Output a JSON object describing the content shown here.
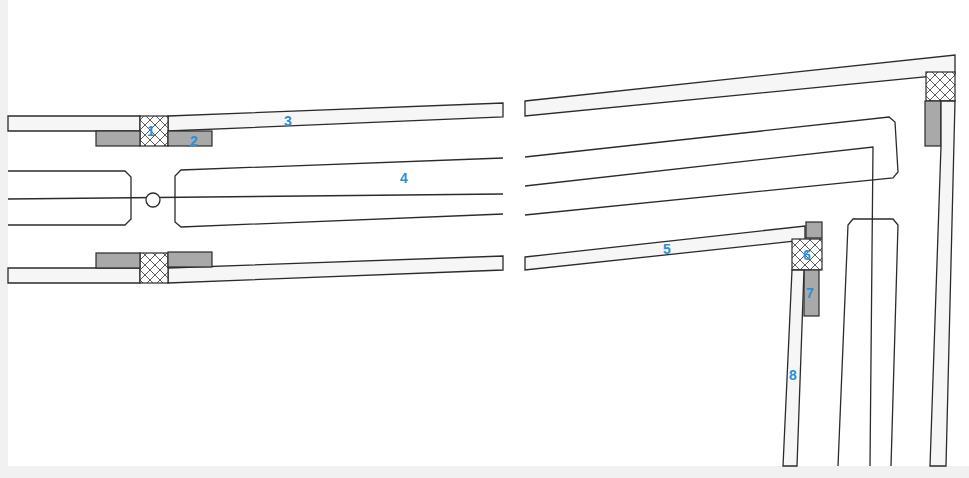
{
  "diagram": {
    "type": "technical-cross-section",
    "labels": [
      {
        "id": "1",
        "text": "1",
        "x": 152,
        "y": 136
      },
      {
        "id": "2",
        "text": "2",
        "x": 195,
        "y": 145
      },
      {
        "id": "3",
        "text": "3",
        "x": 289,
        "y": 125
      },
      {
        "id": "4",
        "text": "4",
        "x": 405,
        "y": 182
      },
      {
        "id": "5",
        "text": "5",
        "x": 668,
        "y": 253
      },
      {
        "id": "6",
        "text": "6",
        "x": 808,
        "y": 260
      },
      {
        "id": "7",
        "text": "7",
        "x": 811,
        "y": 298
      },
      {
        "id": "8",
        "text": "8",
        "x": 794,
        "y": 379
      }
    ],
    "colors": {
      "label": "#2a8fd8",
      "line": "#2b2b2b",
      "seal_fill": "#a9a9a9",
      "background": "#ffffff",
      "frame": "#f1f1f1"
    }
  }
}
